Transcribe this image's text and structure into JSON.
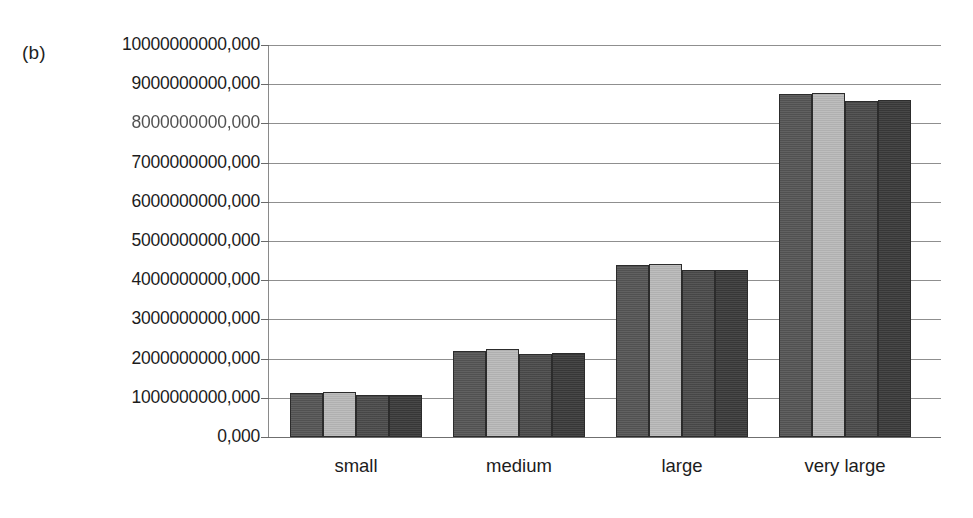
{
  "figure": {
    "panel_label": "(b)"
  },
  "chart_data": {
    "type": "bar",
    "title": "",
    "subtitle": "",
    "xlabel": "",
    "ylabel": "",
    "grid": true,
    "legend": "none",
    "orientation": "vertical",
    "grouping": "grouped",
    "categories": [
      "small",
      "medium",
      "large",
      "very large"
    ],
    "ylim": [
      0,
      10000000000000
    ],
    "ytick_values": [
      0,
      1000000000000,
      2000000000000,
      3000000000000,
      4000000000000,
      5000000000000,
      6000000000000,
      7000000000000,
      8000000000000,
      9000000000000,
      10000000000000
    ],
    "ytick_labels": [
      "0,000",
      "1000000000,000",
      "2000000000,000",
      "3000000000,000",
      "4000000000,000",
      "5000000000,000",
      "6000000000,000",
      "7000000000,000",
      "8000000000,000",
      "9000000000,000",
      "10000000000,000"
    ],
    "series": [
      {
        "name": "series-1",
        "color": "#555555",
        "values": [
          1120000000000,
          2200000000000,
          4380000000000,
          8750000000000
        ]
      },
      {
        "name": "series-2",
        "color": "#b9b9b9",
        "values": [
          1150000000000,
          2250000000000,
          4420000000000,
          8780000000000
        ]
      },
      {
        "name": "series-3",
        "color": "#4a4a4a",
        "values": [
          1070000000000,
          2130000000000,
          4250000000000,
          8580000000000
        ]
      },
      {
        "name": "series-4",
        "color": "#3a3a3a",
        "values": [
          1080000000000,
          2140000000000,
          4270000000000,
          8600000000000
        ]
      }
    ]
  }
}
